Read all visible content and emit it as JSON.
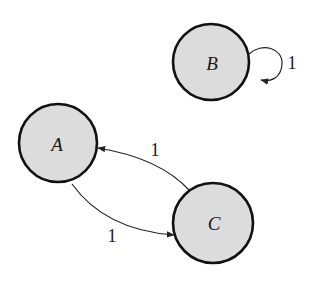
{
  "diagram": {
    "type": "directed-graph",
    "nodes": [
      {
        "id": "A",
        "label": "A",
        "cx": 58,
        "cy": 143,
        "r": 39
      },
      {
        "id": "B",
        "label": "B",
        "cx": 211,
        "cy": 62,
        "r": 38
      },
      {
        "id": "C",
        "label": "C",
        "cx": 213,
        "cy": 223,
        "r": 40
      }
    ],
    "edges": [
      {
        "from": "C",
        "to": "A",
        "label": "1"
      },
      {
        "from": "A",
        "to": "C",
        "label": "1"
      },
      {
        "from": "B",
        "to": "B",
        "label": "1"
      }
    ],
    "colors": {
      "node_fill": "#dcdcdc",
      "node_stroke": "#111111",
      "edge": "#222222"
    }
  }
}
